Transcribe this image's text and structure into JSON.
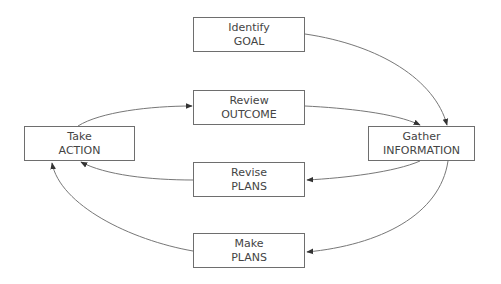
{
  "diagram": {
    "type": "cycle-flowchart",
    "colors": {
      "stroke": "#6e6e6e",
      "text": "#444444",
      "background": "#ffffff"
    },
    "nodes": [
      {
        "id": "identify",
        "line1": "Identify",
        "line2": "GOAL"
      },
      {
        "id": "review",
        "line1": "Review",
        "line2": "OUTCOME"
      },
      {
        "id": "take",
        "line1": "Take",
        "line2": "ACTION"
      },
      {
        "id": "gather",
        "line1": "Gather",
        "line2": "INFORMATION"
      },
      {
        "id": "revise",
        "line1": "Revise",
        "line2": "PLANS"
      },
      {
        "id": "make",
        "line1": "Make",
        "line2": "PLANS"
      }
    ],
    "edges": [
      {
        "from": "identify",
        "to": "gather"
      },
      {
        "from": "review",
        "to": "gather"
      },
      {
        "from": "gather",
        "to": "revise"
      },
      {
        "from": "gather",
        "to": "make"
      },
      {
        "from": "revise",
        "to": "take"
      },
      {
        "from": "make",
        "to": "take"
      },
      {
        "from": "take",
        "to": "review"
      }
    ]
  }
}
